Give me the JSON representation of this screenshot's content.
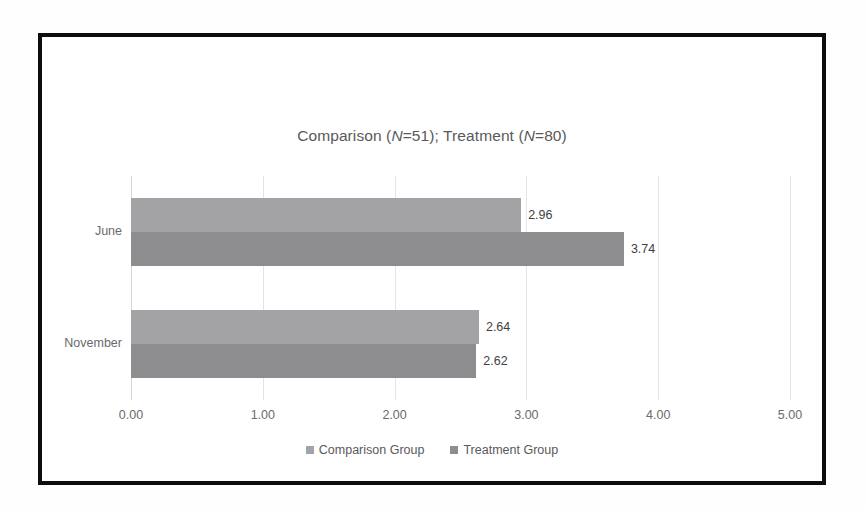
{
  "chart_data": {
    "type": "bar",
    "orientation": "horizontal",
    "title": "Comparison (N=51); Treatment (N=80)",
    "title_parts": {
      "seg1": "Comparison (",
      "n1": "N",
      "seg2": "=51); Treatment (",
      "n2": "N",
      "seg3": "=80)"
    },
    "categories": [
      "June",
      "November"
    ],
    "series": [
      {
        "name": "Comparison Group",
        "color": "#a3a3a5",
        "values": [
          2.96,
          2.64
        ],
        "labels": [
          "2.96",
          "2.64"
        ]
      },
      {
        "name": "Treatment Group",
        "color": "#8d8d90",
        "values": [
          3.74,
          2.62
        ],
        "labels": [
          "3.74",
          "2.62"
        ]
      }
    ],
    "xlabel": "",
    "ylabel": "",
    "xlim": [
      0,
      5
    ],
    "xticks": [
      0,
      1,
      2,
      3,
      4,
      5
    ],
    "xtick_labels": [
      "0.00",
      "1.00",
      "2.00",
      "3.00",
      "4.00",
      "5.00"
    ],
    "grid": "vertical",
    "legend_position": "bottom"
  },
  "figure": {
    "border_color": "#0d0d0d",
    "background": "#ffffff",
    "gridline_color": "#e4e4e6",
    "text_color": "#59595b"
  }
}
